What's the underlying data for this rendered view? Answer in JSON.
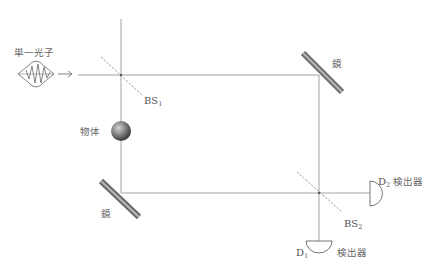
{
  "diagram": {
    "type": "Mach-Zehnder interferometer (interaction-free measurement)",
    "source": {
      "label": "単一光子",
      "icon": "wave-packet-icon",
      "arrow": "→"
    },
    "beam_splitters": [
      {
        "id": "BS1",
        "label_main": "BS",
        "label_sub": "1"
      },
      {
        "id": "BS2",
        "label_main": "BS",
        "label_sub": "2"
      }
    ],
    "mirrors": [
      {
        "id": "mirror-top-right",
        "label": "鏡"
      },
      {
        "id": "mirror-bottom-left",
        "label": "鏡"
      }
    ],
    "object": {
      "label": "物体",
      "icon": "sphere-icon"
    },
    "detectors": [
      {
        "id": "D1",
        "label_main": "D",
        "label_sub": "1",
        "caption": "検出器"
      },
      {
        "id": "D2",
        "label_main": "D",
        "label_sub": "2",
        "caption": "検出器"
      }
    ],
    "colors": {
      "beam": "#9a9a9a",
      "mirror": "#666666",
      "sphere_light": "#bdbdbd",
      "sphere_dark": "#3a3a3a",
      "text": "#555555"
    }
  }
}
